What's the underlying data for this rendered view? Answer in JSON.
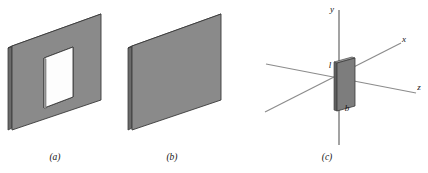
{
  "figure": {
    "background_color": "#ffffff",
    "width": 428,
    "height": 173,
    "panels": [
      {
        "id": "panel-a",
        "caption": "(a)",
        "caption_x": 55,
        "caption_y": 160,
        "description": "rectangular plate with rectangular hole, isometric view"
      },
      {
        "id": "panel-b",
        "caption": "(b)",
        "caption_x": 172,
        "caption_y": 160,
        "description": "solid rectangular plate, isometric view"
      },
      {
        "id": "panel-c",
        "caption": "(c)",
        "caption_x": 327,
        "caption_y": 160,
        "description": "small plate at origin of 3D coordinate axes"
      }
    ]
  },
  "colors": {
    "plate_face": "#8a8a8a",
    "plate_face_c": "#7d7d7d",
    "plate_edge_dark": "#4a4a4a",
    "plate_edge_side": "#6a6a6a",
    "outline": "#3a3a3a",
    "hole_fill": "#fdfdfd",
    "axis_line": "#8c8c8c",
    "axis_line_dark": "#6f6f6f",
    "text": "#141414"
  },
  "axes": {
    "items": [
      {
        "name": "y-axis-label",
        "label": "y",
        "x": 332,
        "y": 12
      },
      {
        "name": "x-axis-label",
        "label": "x",
        "x": 404,
        "y": 42
      },
      {
        "name": "z-axis-label",
        "label": "z",
        "x": 419,
        "y": 90
      }
    ]
  },
  "dimensions": {
    "items": [
      {
        "name": "length-label",
        "label": "l",
        "x": 330,
        "y": 68
      },
      {
        "name": "breadth-label",
        "label": "b",
        "x": 347,
        "y": 111
      }
    ]
  }
}
